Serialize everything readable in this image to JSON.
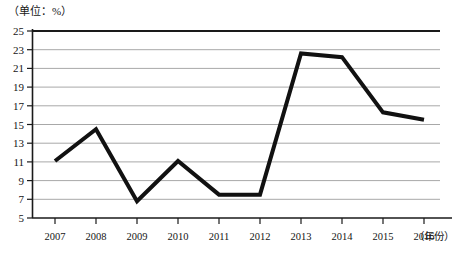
{
  "chart_data": {
    "type": "line",
    "title": "",
    "subtitle": "",
    "unit_label": "（单位：%）",
    "xlabel": "（年份）",
    "ylabel": "",
    "categories": [
      "2007",
      "2008",
      "2009",
      "2010",
      "2011",
      "2012",
      "2013",
      "2014",
      "2015",
      "2016"
    ],
    "values": [
      11.1,
      14.5,
      6.8,
      11.1,
      7.5,
      7.5,
      22.6,
      22.2,
      16.3,
      15.5
    ],
    "series": [
      {
        "name": "",
        "values": [
          11.1,
          14.5,
          6.8,
          11.1,
          7.5,
          7.5,
          22.6,
          22.2,
          16.3,
          15.5
        ]
      }
    ],
    "ylim": [
      5,
      25
    ],
    "ytick_step": 2,
    "ytick_labels": [
      "25",
      "23",
      "21",
      "19",
      "17",
      "15",
      "13",
      "11",
      "9",
      "7",
      "5"
    ],
    "ytick_values": [
      25,
      23,
      21,
      19,
      17,
      15,
      13,
      11,
      9,
      7,
      5
    ],
    "grid": true,
    "grid_axis": "y",
    "legend": false,
    "legend_position": "none",
    "line_color": "#111111",
    "line_width": 4,
    "grid_color": "#aaaaaa",
    "axis_color": "#1a1a1a",
    "markers": false
  },
  "axes": {
    "x_tick_labels": [
      "2007",
      "2008",
      "2009",
      "2010",
      "2011",
      "2012",
      "2013",
      "2014",
      "2015",
      "2016"
    ],
    "y_tick_labels": [
      "25",
      "23",
      "21",
      "19",
      "17",
      "15",
      "13",
      "11",
      "9",
      "7",
      "5"
    ]
  }
}
